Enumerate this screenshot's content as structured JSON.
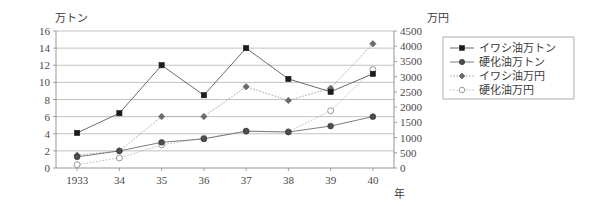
{
  "chart_data": {
    "type": "line",
    "title": "",
    "xlabel": "年",
    "ylabel": "万トン",
    "y2label": "万円",
    "categories": [
      "1933",
      "34",
      "35",
      "36",
      "37",
      "38",
      "39",
      "40"
    ],
    "ylim": [
      0,
      16
    ],
    "y2lim": [
      0,
      4500
    ],
    "yticks": [
      "0",
      "2",
      "4",
      "6",
      "8",
      "10",
      "12",
      "14",
      "16"
    ],
    "y2ticks": [
      "0",
      "500",
      "1000",
      "1500",
      "2000",
      "2500",
      "3000",
      "3500",
      "4000",
      "4500"
    ],
    "grid": true,
    "legend_position": "right",
    "series": [
      {
        "name": "イワシ油万トン",
        "axis": "left",
        "unit": "万トン",
        "marker": "filled-square",
        "linestyle": "solid",
        "values": [
          4.1,
          6.4,
          12.0,
          8.5,
          14.0,
          10.4,
          8.9,
          11.0
        ]
      },
      {
        "name": "硬化油万トン",
        "axis": "left",
        "unit": "万トン",
        "marker": "filled-circle",
        "linestyle": "solid",
        "values": [
          1.3,
          2.0,
          3.0,
          3.4,
          4.3,
          4.2,
          4.9,
          6.0
        ]
      },
      {
        "name": "イワシ油万円",
        "axis": "right",
        "unit": "万円",
        "marker": "filled-diamond",
        "linestyle": "dotted",
        "values": [
          420,
          560,
          1690,
          1690,
          2670,
          2220,
          2620,
          4080
        ]
      },
      {
        "name": "硬化油万円",
        "axis": "right",
        "unit": "万円",
        "marker": "open-circle",
        "linestyle": "dotted",
        "values": [
          110,
          330,
          760,
          980,
          1210,
          1190,
          1880,
          3230
        ]
      }
    ]
  },
  "legend": {
    "items": [
      {
        "label": "イワシ油万トン",
        "marker": "filled-square"
      },
      {
        "label": "硬化油万トン",
        "marker": "filled-circle"
      },
      {
        "label": "イワシ油万円",
        "marker": "filled-diamond"
      },
      {
        "label": "硬化油万円",
        "marker": "open-circle"
      }
    ]
  }
}
